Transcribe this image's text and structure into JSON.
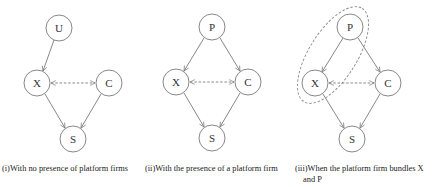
{
  "colors": {
    "stroke": "#7a7a7a",
    "text": "#222222",
    "background": "#ffffff"
  },
  "panels": [
    {
      "id": "i",
      "caption": "(i)With no presence of platform firms",
      "nodes": [
        {
          "id": "U",
          "label": "U",
          "x": 59,
          "y": 28
        },
        {
          "id": "X",
          "label": "X",
          "x": 37,
          "y": 83
        },
        {
          "id": "C",
          "label": "C",
          "x": 109,
          "y": 83
        },
        {
          "id": "S",
          "label": "S",
          "x": 73,
          "y": 139
        }
      ],
      "edges": [
        {
          "from": "U",
          "to": "X",
          "style": "solid"
        },
        {
          "from": "X",
          "to": "C",
          "style": "dashed-bidirectional"
        },
        {
          "from": "X",
          "to": "S",
          "style": "solid"
        },
        {
          "from": "C",
          "to": "S",
          "style": "solid"
        }
      ]
    },
    {
      "id": "ii",
      "caption": "(ii)With the presence of a platform firm",
      "nodes": [
        {
          "id": "P",
          "label": "P",
          "x": 212,
          "y": 27
        },
        {
          "id": "X",
          "label": "X",
          "x": 176,
          "y": 82
        },
        {
          "id": "C",
          "label": "C",
          "x": 248,
          "y": 82
        },
        {
          "id": "S",
          "label": "S",
          "x": 212,
          "y": 138
        }
      ],
      "edges": [
        {
          "from": "P",
          "to": "X",
          "style": "solid"
        },
        {
          "from": "P",
          "to": "C",
          "style": "solid"
        },
        {
          "from": "X",
          "to": "C",
          "style": "dashed-bidirectional"
        },
        {
          "from": "X",
          "to": "S",
          "style": "solid"
        },
        {
          "from": "C",
          "to": "S",
          "style": "solid"
        }
      ]
    },
    {
      "id": "iii",
      "caption_line1": "(iii)When the platform firm bundles X",
      "caption_line2": "and P",
      "nodes": [
        {
          "id": "P",
          "label": "P",
          "x": 350,
          "y": 27
        },
        {
          "id": "X",
          "label": "X",
          "x": 315,
          "y": 83
        },
        {
          "id": "C",
          "label": "C",
          "x": 388,
          "y": 83
        },
        {
          "id": "S",
          "label": "S",
          "x": 352,
          "y": 139
        }
      ],
      "edges": [
        {
          "from": "P",
          "to": "X",
          "style": "solid"
        },
        {
          "from": "P",
          "to": "C",
          "style": "solid"
        },
        {
          "from": "X",
          "to": "C",
          "style": "dashed-bidirectional"
        },
        {
          "from": "X",
          "to": "S",
          "style": "solid"
        },
        {
          "from": "C",
          "to": "S",
          "style": "solid"
        }
      ],
      "bundle": {
        "encloses": [
          "P",
          "X"
        ],
        "style": "dashed-ellipse"
      }
    }
  ]
}
